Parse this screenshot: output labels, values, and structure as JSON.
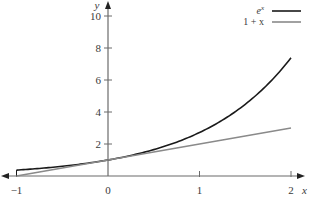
{
  "chart_data": {
    "type": "line",
    "title": "",
    "xlabel": "x",
    "ylabel": "y",
    "xlim": [
      -1,
      2
    ],
    "ylim": [
      0,
      10.5
    ],
    "x_ticks": [
      -1,
      0,
      1,
      2
    ],
    "x_tick_labels": [
      "−1",
      "0",
      "1",
      "2"
    ],
    "y_ticks": [
      2,
      4,
      6,
      8,
      10
    ],
    "y_tick_labels": [
      "2",
      "4",
      "6",
      "8",
      "10"
    ],
    "grid": false,
    "legend_position": "upper right",
    "x": [
      -1,
      -0.75,
      -0.5,
      -0.25,
      0,
      0.25,
      0.5,
      0.75,
      1,
      1.25,
      1.5,
      1.75,
      2
    ],
    "series": [
      {
        "name": "e^x",
        "color": "#1a1a1a",
        "values": [
          0.37,
          0.47,
          0.61,
          0.78,
          1.0,
          1.28,
          1.65,
          2.12,
          2.72,
          3.49,
          4.48,
          5.75,
          7.39
        ]
      },
      {
        "name": "1 + x",
        "color": "#8a8a8a",
        "values": [
          0,
          0.25,
          0.5,
          0.75,
          1.0,
          1.25,
          1.5,
          1.75,
          2.0,
          2.25,
          2.5,
          2.75,
          3.0
        ]
      }
    ]
  },
  "legend": {
    "items": [
      {
        "label": "e",
        "sup": "x",
        "color": "#1a1a1a"
      },
      {
        "label": "1 + x",
        "sup": "",
        "color": "#8a8a8a"
      }
    ]
  }
}
